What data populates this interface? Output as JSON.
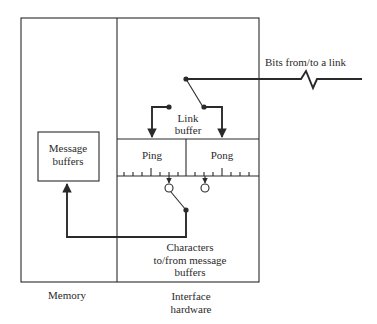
{
  "diagram": {
    "colors": {
      "line": "#2a2a2a",
      "background": "#ffffff"
    },
    "labels": {
      "bits_link": "Bits from/to a link",
      "link_buffer_line1": "Link",
      "link_buffer_line2": "buffer",
      "ping": "Ping",
      "pong": "Pong",
      "message_buffers_line1": "Message",
      "message_buffers_line2": "buffers",
      "characters_line1": "Characters",
      "characters_line2": "to/from message",
      "characters_line3": "buffers",
      "memory": "Memory",
      "interface_line1": "Interface",
      "interface_line2": "hardware"
    },
    "regions": [
      {
        "name": "Memory"
      },
      {
        "name": "Interface hardware"
      }
    ],
    "components": [
      {
        "name": "Message buffers",
        "region": "Memory"
      },
      {
        "name": "Link buffer",
        "region": "Interface hardware",
        "halves": [
          "Ping",
          "Pong"
        ]
      }
    ],
    "connections": [
      {
        "from": "link",
        "to": "Link buffer switch",
        "label": "Bits from/to a link"
      },
      {
        "from": "Link buffer switch",
        "to": "Ping"
      },
      {
        "from": "Link buffer switch",
        "to": "Pong"
      },
      {
        "from": "Ping/Pong character switch",
        "to": "Message buffers",
        "label": "Characters to/from message buffers"
      }
    ]
  }
}
